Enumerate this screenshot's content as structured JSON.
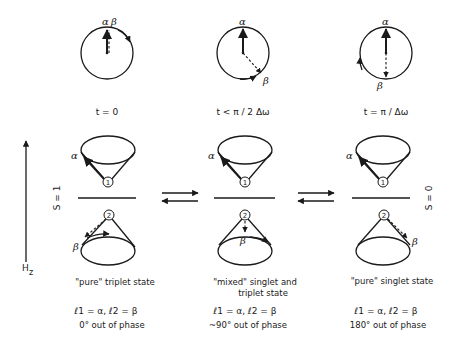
{
  "diagram": {
    "colors": {
      "ink": "#1a1a1a",
      "background": "#ffffff"
    },
    "phase_circles": [
      {
        "time_label": "t = 0",
        "alpha_label": "α",
        "beta_label": "β"
      },
      {
        "time_label": "t < π / 2 Δω",
        "alpha_label": "α",
        "beta_label": "β"
      },
      {
        "time_label": "t = π / Δω",
        "alpha_label": "α",
        "beta_label": "β"
      }
    ],
    "field_axis": {
      "label_main": "H",
      "label_sub": "z"
    },
    "spin_labels": {
      "left": "S = 1",
      "right": "S = 0"
    },
    "cones": {
      "electron_1_label": "1",
      "electron_2_label": "2",
      "alpha": "α",
      "beta": "β"
    },
    "states": [
      {
        "title_line1": "\"pure\" triplet state",
        "title_line2": "",
        "spin_assignment": "ℓ1 = α, ℓ2 = β",
        "phase": "0° out of phase"
      },
      {
        "title_line1": "\"mixed\" singlet and",
        "title_line2": "triplet state",
        "spin_assignment": "ℓ1 = α, ℓ2 = β",
        "phase": "~90° out of phase"
      },
      {
        "title_line1": "\"pure\" singlet state",
        "title_line2": "",
        "spin_assignment": "ℓ1 = α, ℓ2 = β",
        "phase": "180° out of phase"
      }
    ]
  }
}
